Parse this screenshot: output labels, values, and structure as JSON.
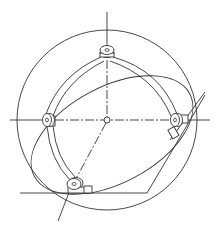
{
  "figure": {
    "title": "Gimbal / gyroscope frame line drawing",
    "line_color": "#333333",
    "background_color": "#ffffff",
    "components": [
      {
        "id": "outer-circle",
        "label": "Outer circle"
      },
      {
        "id": "inner-ring",
        "label": "Tilted inner ring"
      },
      {
        "id": "vertical-axis",
        "label": "Vertical axis"
      },
      {
        "id": "horizontal-axis",
        "label": "Horizontal axis (dash-dot)"
      },
      {
        "id": "diagonal-axis",
        "label": "Diagonal axis (dash-dot)"
      },
      {
        "id": "center-node",
        "label": "Center node"
      },
      {
        "id": "pivot-top",
        "label": "Top pivot"
      },
      {
        "id": "pivot-left",
        "label": "Left pivot"
      },
      {
        "id": "pivot-right",
        "label": "Right pivot"
      },
      {
        "id": "pivot-bottom",
        "label": "Bottom pivot"
      },
      {
        "id": "frame-arms",
        "label": "Curved frame arms"
      },
      {
        "id": "base-line",
        "label": "Base reference line"
      }
    ]
  }
}
